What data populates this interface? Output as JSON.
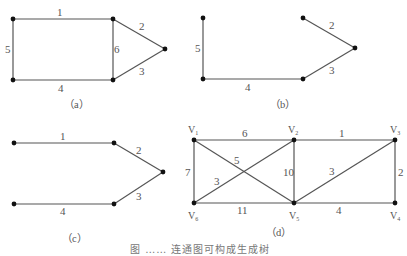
{
  "figure": {
    "caption_partial": "图 …… 连通图可构成生成树",
    "subfigures": [
      {
        "id": "a",
        "label": "（a）",
        "nodes": [
          {
            "id": "a1",
            "x": 13,
            "y": 19
          },
          {
            "id": "a2",
            "x": 113,
            "y": 19
          },
          {
            "id": "a3",
            "x": 165,
            "y": 49
          },
          {
            "id": "a4",
            "x": 113,
            "y": 80
          },
          {
            "id": "a5",
            "x": 13,
            "y": 80
          }
        ],
        "edges": [
          {
            "from": "a1",
            "to": "a2",
            "weight": "1"
          },
          {
            "from": "a2",
            "to": "a3",
            "weight": "2"
          },
          {
            "from": "a3",
            "to": "a4",
            "weight": "3"
          },
          {
            "from": "a5",
            "to": "a4",
            "weight": "4"
          },
          {
            "from": "a1",
            "to": "a5",
            "weight": "5"
          },
          {
            "from": "a2",
            "to": "a4",
            "weight": "6"
          }
        ]
      },
      {
        "id": "b",
        "label": "（b）",
        "nodes": [
          {
            "id": "b1",
            "x": 203,
            "y": 18
          },
          {
            "id": "b2",
            "x": 303,
            "y": 18
          },
          {
            "id": "b3",
            "x": 355,
            "y": 48
          },
          {
            "id": "b4",
            "x": 303,
            "y": 79
          },
          {
            "id": "b5",
            "x": 203,
            "y": 79
          }
        ],
        "edges": [
          {
            "from": "b2",
            "to": "b3",
            "weight": "2"
          },
          {
            "from": "b3",
            "to": "b4",
            "weight": "3"
          },
          {
            "from": "b5",
            "to": "b4",
            "weight": "4"
          },
          {
            "from": "b1",
            "to": "b5",
            "weight": "5"
          }
        ]
      },
      {
        "id": "c",
        "label": "（c）",
        "nodes": [
          {
            "id": "c1",
            "x": 14,
            "y": 143
          },
          {
            "id": "c2",
            "x": 114,
            "y": 143
          },
          {
            "id": "c3",
            "x": 163,
            "y": 172
          },
          {
            "id": "c4",
            "x": 114,
            "y": 204
          },
          {
            "id": "c5",
            "x": 14,
            "y": 204
          }
        ],
        "edges": [
          {
            "from": "c1",
            "to": "c2",
            "weight": "1"
          },
          {
            "from": "c2",
            "to": "c3",
            "weight": "2"
          },
          {
            "from": "c3",
            "to": "c4",
            "weight": "3"
          },
          {
            "from": "c5",
            "to": "c4",
            "weight": "4"
          }
        ]
      },
      {
        "id": "d",
        "label": "（d）",
        "nodes": [
          {
            "id": "V1",
            "name": "V",
            "sub": "1",
            "x": 194,
            "y": 140
          },
          {
            "id": "V2",
            "name": "V",
            "sub": "2",
            "x": 294,
            "y": 140
          },
          {
            "id": "V3",
            "name": "V",
            "sub": "3",
            "x": 395,
            "y": 140
          },
          {
            "id": "V4",
            "name": "V",
            "sub": "4",
            "x": 395,
            "y": 203
          },
          {
            "id": "V5",
            "name": "V",
            "sub": "5",
            "x": 294,
            "y": 203
          },
          {
            "id": "V6",
            "name": "V",
            "sub": "6",
            "x": 194,
            "y": 203
          }
        ],
        "edges": [
          {
            "from": "V1",
            "to": "V2",
            "weight": "6"
          },
          {
            "from": "V2",
            "to": "V3",
            "weight": "1"
          },
          {
            "from": "V3",
            "to": "V4",
            "weight": "2"
          },
          {
            "from": "V5",
            "to": "V3",
            "weight": "3"
          },
          {
            "from": "V5",
            "to": "V4",
            "weight": "4"
          },
          {
            "from": "V1",
            "to": "V5",
            "weight": "5"
          },
          {
            "from": "V6",
            "to": "V2",
            "weight": "3"
          },
          {
            "from": "V1",
            "to": "V6",
            "weight": "7"
          },
          {
            "from": "V2",
            "to": "V5",
            "weight": "10"
          },
          {
            "from": "V6",
            "to": "V5",
            "weight": "11"
          }
        ]
      }
    ]
  }
}
